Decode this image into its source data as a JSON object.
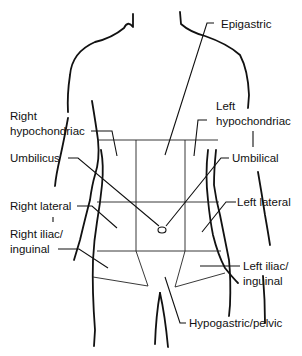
{
  "diagram": {
    "labels": {
      "epigastric": "Epigastric",
      "right_hypochondriac_1": "Right",
      "right_hypochondriac_2": "hypochondriac",
      "left_hypochondriac_1": "Left",
      "left_hypochondriac_2": "hypochondriac",
      "umbilicus": "Umbilicus",
      "umbilical": "Umbilical",
      "right_lateral": "Right lateral",
      "left_lateral": "Left lateral",
      "right_iliac_1": "Right iliac/",
      "right_iliac_2": "inguinal",
      "left_iliac_1": "Left iliac/",
      "left_iliac_2": "inguinal",
      "hypogastric": "Hypogastric/pelvic"
    },
    "colors": {
      "line": "#111111",
      "background": "#ffffff"
    }
  }
}
